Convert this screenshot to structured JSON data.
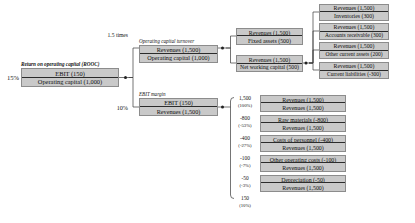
{
  "diagram": {
    "box_fill": "#c9c9c9",
    "box_stroke": "#8c8c8c",
    "rule_color": "#2b2b2b"
  },
  "level1": {
    "caption": "Return on operating capital (ROOC)",
    "result": "15%",
    "numerator": "EBIT (150)",
    "denominator": "Operating capital (1,000)"
  },
  "level2": {
    "turnover": {
      "caption": "Operating capital turnover",
      "result": "1.5 times",
      "numerator": "Revenues (1,500)",
      "denominator": "Operating capital (1,000)"
    },
    "margin": {
      "caption": "EBIT margin",
      "result": "10%",
      "numerator": "EBIT (150)",
      "denominator": "Revenues (1,500)"
    }
  },
  "level3": {
    "capital_items": [
      {
        "numerator": "Revenues (1,500)",
        "denominator": "Fixed assets (500)"
      },
      {
        "numerator": "Revenues (1,500)",
        "denominator": "Net working capital (500)"
      }
    ]
  },
  "level4": {
    "working_capital_items": [
      {
        "numerator": "Revenues (1,500)",
        "denominator": "Inventories (300)"
      },
      {
        "numerator": "Revenues (1,500)",
        "denominator": "Accounts receivable (300)"
      },
      {
        "numerator": "Revenues (1,500)",
        "denominator": "Other current assets (200)"
      },
      {
        "numerator": "Revenues (1,500)",
        "denominator": "Current liabilities (-300)"
      }
    ]
  },
  "margin_breakdown": {
    "items": [
      {
        "amount": "1,500",
        "percent": "(100%)",
        "numerator": "Revenues (1,500)",
        "denominator": "Revenues (1,500)"
      },
      {
        "amount": "-800",
        "percent": "(-53%)",
        "numerator": "Raw materials (-800)",
        "denominator": "Revenues (1,500)"
      },
      {
        "amount": "-400",
        "percent": "(-27%)",
        "numerator": "Costs of personnel (-400)",
        "denominator": "Revenues (1,500)"
      },
      {
        "amount": "-100",
        "percent": "(-7%)",
        "numerator": "Other operating costs (-100)",
        "denominator": "Revenues (1,500)"
      },
      {
        "amount": "-50",
        "percent": "(-3%)",
        "numerator": "Depreciation (-50)",
        "denominator": "Revenues (1,500)"
      }
    ],
    "total": {
      "amount": "150",
      "percent": "(10%)"
    }
  }
}
